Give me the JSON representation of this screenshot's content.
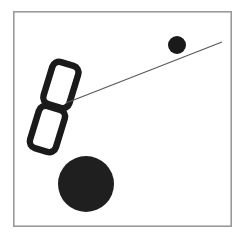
{
  "canvas": {
    "width": 243,
    "height": 236,
    "background_color": "#ffffff",
    "title": "Tilted letter B with connector line and two filled circles"
  },
  "frame": {
    "name": "border-frame",
    "x": 13,
    "y": 11,
    "width": 219,
    "height": 216,
    "stroke_color": "#9a9a9a",
    "stroke_width": 1.6,
    "fill": "none"
  },
  "shapes": {
    "letter_b": {
      "label": "B",
      "description": "Hand-drawn outline letter B, two rounded rectangular bowls, tilted clockwise",
      "rotation_degrees": 17,
      "stroke_color": "#1a1a1a",
      "stroke_width": 6.5,
      "fill": "none",
      "upper_bowl": {
        "x": 33,
        "y": 62,
        "width": 27,
        "height": 44,
        "corner_radius": 7
      },
      "lower_bowl": {
        "x": 40,
        "y": 108,
        "width": 27,
        "height": 44,
        "corner_radius": 7
      },
      "bounds": {
        "x": 28,
        "y": 58,
        "width": 52,
        "height": 99
      }
    },
    "connector_line": {
      "label": "connector",
      "x1": 66,
      "y1": 103,
      "x2": 222,
      "y2": 42,
      "stroke_color": "#5a5a5a",
      "stroke_width": 1.3
    },
    "small_circle": {
      "label": "small dot",
      "cx": 177,
      "cy": 45,
      "r": 9,
      "fill_color": "#1a1a1a"
    },
    "large_circle": {
      "label": "large dot",
      "cx": 86,
      "cy": 184,
      "r": 28,
      "fill_color": "#1f1f1f"
    }
  },
  "colors": {
    "ink": "#1a1a1a",
    "frame": "#9a9a9a",
    "line": "#5a5a5a",
    "paper": "#ffffff"
  }
}
